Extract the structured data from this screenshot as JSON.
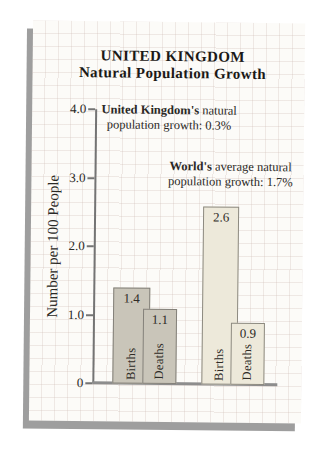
{
  "title": {
    "line1": "UNITED KINGDOM",
    "line2": "Natural Population Growth"
  },
  "chart_data": {
    "type": "bar",
    "title": "UNITED KINGDOM Natural Population Growth",
    "ylabel": "Number per 100 People",
    "xlabel": "",
    "ylim": [
      0,
      4
    ],
    "grid": "faint graph-paper grid on page background",
    "legend_position": "none",
    "categories": [
      "Births",
      "Deaths"
    ],
    "series": [
      {
        "name": "United Kingdom",
        "values": [
          1.4,
          1.1
        ]
      },
      {
        "name": "World",
        "values": [
          2.6,
          0.9
        ]
      }
    ],
    "yticks": [
      {
        "value": 4,
        "label": "4.0"
      },
      {
        "value": 3,
        "label": "3.0"
      },
      {
        "value": 2,
        "label": "2.0"
      },
      {
        "value": 1,
        "label": "1.0"
      },
      {
        "value": 0,
        "label": "0"
      }
    ],
    "annotations": [
      {
        "bold": "United Kingdom's",
        "line1_rest": " natural",
        "line2": "population growth:  0.3%"
      },
      {
        "bold": "World's",
        "line1_rest": " average natural",
        "line2": "population growth:  1.7%"
      }
    ]
  },
  "colors": {
    "uk_bar_fill": "#c9c5b9",
    "uk_bar_border": "#84817a",
    "world_bar_fill": "#ede9da",
    "world_bar_border": "#8d8a80",
    "axis": "#747474",
    "baseline": "#8d8d8d",
    "page_shadow": "#9e9e9e"
  }
}
